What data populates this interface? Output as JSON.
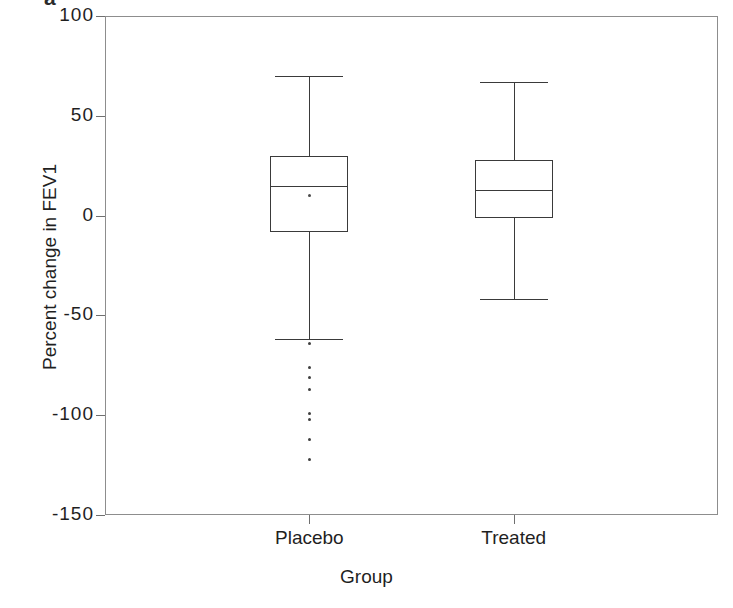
{
  "figure": {
    "caption_fragment": "a",
    "background_color": "#ffffff",
    "frame_color": "#8d8d8d",
    "ink_color": "#3a3a3a"
  },
  "chart_data": {
    "type": "box",
    "title": "",
    "xlabel": "Group",
    "ylabel": "Percent change in FEV1",
    "categories": [
      "Placebo",
      "Treated"
    ],
    "ylim": [
      -150,
      100
    ],
    "yticks": [
      100,
      50,
      0,
      -50,
      -100,
      -150
    ],
    "ytick_labels": [
      "100",
      "50",
      "0",
      "-50",
      "-100",
      "-150"
    ],
    "grid": false,
    "legend": "none",
    "series": [
      {
        "name": "Placebo",
        "whisker_high": 70,
        "q3": 30,
        "median": 15,
        "mean": 10,
        "q1": -8,
        "whisker_low": -62,
        "outliers": [
          -64,
          -76,
          -81,
          -87,
          -99,
          -102,
          -112,
          -122
        ]
      },
      {
        "name": "Treated",
        "whisker_high": 67,
        "q3": 28,
        "median": 13,
        "mean": 13,
        "q1": -1,
        "whisker_low": -42,
        "outliers": []
      }
    ]
  }
}
